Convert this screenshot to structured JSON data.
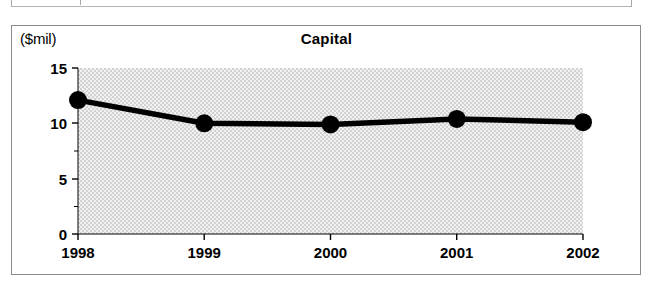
{
  "figure": {
    "unit_label": "($mil)",
    "title": "Capital"
  },
  "top_table": {
    "visible_fragment": ""
  },
  "chart_data": {
    "type": "line",
    "title": "Capital",
    "xlabel": "",
    "ylabel": "($mil)",
    "categories": [
      "1998",
      "1999",
      "2000",
      "2001",
      "2002"
    ],
    "x": [
      1998,
      1999,
      2000,
      2001,
      2002
    ],
    "values": [
      12.1,
      10.0,
      9.9,
      10.4,
      10.1
    ],
    "series": [
      {
        "name": "Capital",
        "values": [
          12.1,
          10.0,
          9.9,
          10.4,
          10.1
        ]
      }
    ],
    "ylim": [
      0,
      15
    ],
    "yticks": [
      0,
      5,
      10,
      15
    ],
    "ytick_labels": [
      "0",
      "5",
      "10",
      "15"
    ],
    "yminor_ticks": [
      2.5,
      7.5,
      12.5
    ],
    "grid": false,
    "legend": false,
    "legend_position": "none",
    "marker": "filled-circle",
    "line_color": "#000000",
    "marker_color": "#000000",
    "plot_background": "#e4e4e4"
  },
  "axis_labels": {
    "y": [
      "15",
      "10",
      "5",
      "0"
    ],
    "x": [
      "1998",
      "1999",
      "2000",
      "2001",
      "2002"
    ]
  }
}
